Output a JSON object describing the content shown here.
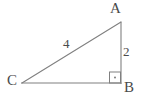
{
  "figure": {
    "type": "right-triangle-diagram",
    "background_color": "#ffffff",
    "stroke_color": "#808080",
    "label_color": "#4a4a4a",
    "vertices": {
      "a": {
        "label": "A",
        "x": 121,
        "y": 22
      },
      "b": {
        "label": "B",
        "x": 121,
        "y": 83
      },
      "c": {
        "label": "C",
        "x": 22,
        "y": 83
      }
    },
    "sides": {
      "hypotenuse": {
        "label": "4",
        "from": "C",
        "to": "A"
      },
      "vertical": {
        "label": "2",
        "from": "A",
        "to": "B"
      },
      "base": {
        "label": "",
        "from": "C",
        "to": "B"
      }
    },
    "right_angle": {
      "at_vertex": "B",
      "marker": "square-with-dot",
      "size": 11
    }
  }
}
